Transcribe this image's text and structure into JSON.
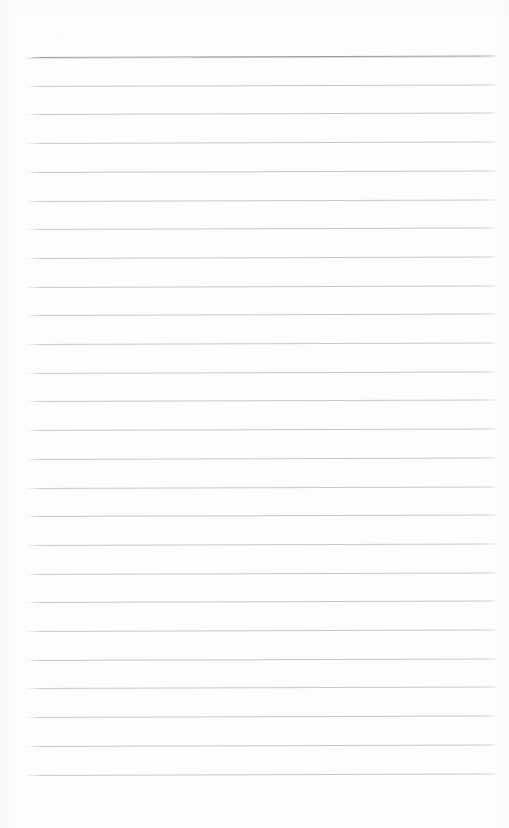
{
  "document": {
    "kind": "scanned-lined-paper",
    "description": "Blank ruled notepad sheet, scanned",
    "page_width": 509,
    "page_height": 828,
    "background_color": "#fdfdfd",
    "text_content": "",
    "line_count": 26
  },
  "ruling": {
    "line_color": "#c8c8c8",
    "header_line_color": "#9c9c9c",
    "left_margin_x": 26,
    "right_margin_x": 495,
    "first_line_y": 57,
    "line_spacing": 28.7,
    "skew_degrees": -0.17,
    "lines": [
      {
        "index": 1,
        "y": 57,
        "emphasis": "header"
      },
      {
        "index": 2,
        "y": 85.7,
        "emphasis": "normal"
      },
      {
        "index": 3,
        "y": 114.4,
        "emphasis": "normal"
      },
      {
        "index": 4,
        "y": 143.1,
        "emphasis": "normal"
      },
      {
        "index": 5,
        "y": 171.8,
        "emphasis": "normal"
      },
      {
        "index": 6,
        "y": 200.5,
        "emphasis": "normal"
      },
      {
        "index": 7,
        "y": 229.2,
        "emphasis": "normal"
      },
      {
        "index": 8,
        "y": 257.9,
        "emphasis": "normal"
      },
      {
        "index": 9,
        "y": 286.6,
        "emphasis": "normal"
      },
      {
        "index": 10,
        "y": 315.3,
        "emphasis": "normal"
      },
      {
        "index": 11,
        "y": 344.0,
        "emphasis": "normal"
      },
      {
        "index": 12,
        "y": 372.7,
        "emphasis": "normal"
      },
      {
        "index": 13,
        "y": 401.4,
        "emphasis": "normal"
      },
      {
        "index": 14,
        "y": 430.1,
        "emphasis": "normal"
      },
      {
        "index": 15,
        "y": 458.8,
        "emphasis": "normal"
      },
      {
        "index": 16,
        "y": 487.5,
        "emphasis": "normal"
      },
      {
        "index": 17,
        "y": 516.2,
        "emphasis": "normal"
      },
      {
        "index": 18,
        "y": 544.9,
        "emphasis": "normal"
      },
      {
        "index": 19,
        "y": 573.6,
        "emphasis": "normal"
      },
      {
        "index": 20,
        "y": 602.3,
        "emphasis": "normal"
      },
      {
        "index": 21,
        "y": 631.0,
        "emphasis": "normal"
      },
      {
        "index": 22,
        "y": 659.7,
        "emphasis": "normal"
      },
      {
        "index": 23,
        "y": 688.4,
        "emphasis": "normal"
      },
      {
        "index": 24,
        "y": 717.1,
        "emphasis": "normal"
      },
      {
        "index": 25,
        "y": 745.8,
        "emphasis": "normal"
      },
      {
        "index": 26,
        "y": 774.5,
        "emphasis": "normal"
      }
    ]
  }
}
